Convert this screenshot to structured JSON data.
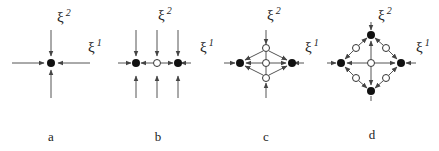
{
  "figure": {
    "panels": [
      {
        "label": "a",
        "xi1": "ξ",
        "xi1_sup": "1",
        "xi2": "ξ",
        "xi2_sup": "2"
      },
      {
        "label": "b",
        "xi1": "ξ",
        "xi1_sup": "1",
        "xi2": "ξ",
        "xi2_sup": "2"
      },
      {
        "label": "c",
        "xi1": "ξ",
        "xi1_sup": "1",
        "xi2": "ξ",
        "xi2_sup": "2"
      },
      {
        "label": "d",
        "xi1": "ξ",
        "xi1_sup": "1",
        "xi2": "ξ",
        "xi2_sup": "2"
      }
    ],
    "legend": {
      "filled_node": "filled circle",
      "open_node": "open circle"
    },
    "colors": {
      "ink": "#111111",
      "line": "#555555",
      "background": "#ffffff"
    }
  }
}
